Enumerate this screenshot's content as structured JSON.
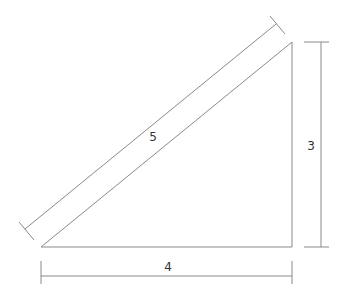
{
  "diagram": {
    "type": "right-triangle-dimensions",
    "labels": {
      "hypotenuse": "5",
      "height": "3",
      "base": "4"
    },
    "colors": {
      "line": "#8a8a8a",
      "text": "#333333",
      "background": "#ffffff"
    }
  }
}
